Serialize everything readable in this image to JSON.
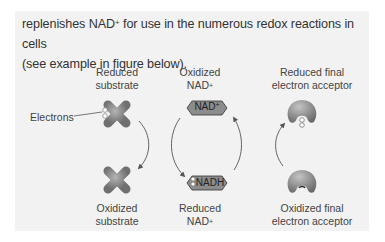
{
  "paragraph": {
    "line1_pre": "replenishes NAD",
    "line1_sup": "+",
    "line1_post": " for use in the numerous redox reactions in cells",
    "line2": "(see example in figure below)."
  },
  "figure": {
    "labels": {
      "reduced_substrate": [
        "Reduced",
        "substrate"
      ],
      "oxidized_substrate": [
        "Oxidized",
        "substrate"
      ],
      "oxidized_nad": [
        "Oxidized",
        "NAD",
        "+"
      ],
      "reduced_nad": [
        "Reduced",
        "NAD",
        "+"
      ],
      "reduced_final_acceptor": [
        "Reduced final",
        "electron acceptor"
      ],
      "oxidized_final_acceptor": [
        "Oxidized final",
        "electron acceptor"
      ],
      "electrons": "Electrons"
    },
    "tags": {
      "nad_plus": "NAD",
      "nad_plus_sup": "+",
      "nadh": "NADH"
    },
    "colors": {
      "panel": "#f2f2f2",
      "shape_fill": "#8a8a8a",
      "arrow": "#555555"
    }
  }
}
